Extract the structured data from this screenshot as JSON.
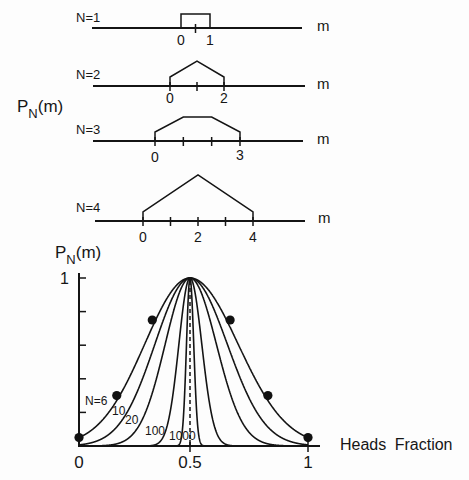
{
  "chart_data": [
    {
      "type": "line",
      "title": "",
      "ylabel": "P_N(m)",
      "ylabel_parts": {
        "base": "P",
        "sub": "N",
        "arg": "(m)"
      },
      "xlabel": "m",
      "grid": false,
      "series": [
        {
          "name": "N=1",
          "label": "N=1",
          "axis_label": "m",
          "ticks": [
            0.5
          ],
          "tick_labels": [
            {
              "m": 0,
              "text": "0"
            },
            {
              "m": 1,
              "text": "1"
            }
          ],
          "shape": [
            [
              0,
              0
            ],
            [
              0,
              14
            ],
            [
              1,
              14
            ],
            [
              1,
              0
            ]
          ]
        },
        {
          "name": "N=2",
          "label": "N=2",
          "axis_label": "m",
          "ticks": [
            0,
            1,
            2
          ],
          "tick_labels": [
            {
              "m": 0,
              "text": "0"
            },
            {
              "m": 2,
              "text": "2"
            }
          ],
          "shape": [
            [
              0,
              0
            ],
            [
              0,
              9
            ],
            [
              1,
              25
            ],
            [
              2,
              9
            ],
            [
              2,
              0
            ]
          ]
        },
        {
          "name": "N=3",
          "label": "N=3",
          "axis_label": "m",
          "ticks": [
            0,
            1,
            2,
            3
          ],
          "tick_labels": [
            {
              "m": 0,
              "text": "0"
            },
            {
              "m": 3,
              "text": "3"
            }
          ],
          "shape": [
            [
              0,
              0
            ],
            [
              0,
              9
            ],
            [
              1,
              24
            ],
            [
              2,
              24
            ],
            [
              3,
              9
            ],
            [
              3,
              0
            ]
          ]
        },
        {
          "name": "N=4",
          "label": "N=4",
          "axis_label": "m",
          "ticks": [
            0,
            1,
            2,
            3,
            4
          ],
          "tick_labels": [
            {
              "m": 0,
              "text": "0"
            },
            {
              "m": 2,
              "text": "2"
            },
            {
              "m": 4,
              "text": "4"
            }
          ],
          "shape": [
            [
              0,
              0
            ],
            [
              0,
              9
            ],
            [
              2,
              46
            ],
            [
              4,
              9
            ],
            [
              4,
              0
            ]
          ]
        }
      ]
    },
    {
      "type": "line",
      "title": "",
      "ylabel": "P_N(m)",
      "ylabel_parts": {
        "base": "P",
        "sub": "N",
        "arg": "(m)"
      },
      "xlabel": "Heads Fraction",
      "xlim": [
        0,
        1
      ],
      "ylim": [
        0,
        1
      ],
      "grid": false,
      "x_ticks": [
        0,
        0.5,
        1
      ],
      "x_tick_labels": [
        "0",
        "0.5",
        "1"
      ],
      "y_ticks": [
        0.2,
        0.4,
        0.6,
        0.8,
        1.0
      ],
      "y_tick_labels": [
        "",
        "",
        "",
        "",
        "1"
      ],
      "x": [
        0,
        0.1,
        0.2,
        0.3,
        0.4,
        0.5,
        0.6,
        0.7,
        0.8,
        0.9,
        1.0
      ],
      "series": [
        {
          "name": "N=6",
          "label": "N=6",
          "N": 6,
          "values": [
            0.05,
            0.15,
            0.34,
            0.62,
            0.89,
            1,
            0.89,
            0.62,
            0.34,
            0.15,
            0.05
          ]
        },
        {
          "name": "N=10",
          "label": "10",
          "N": 10,
          "values": [
            0.01,
            0.04,
            0.17,
            0.45,
            0.82,
            1,
            0.82,
            0.45,
            0.17,
            0.04,
            0.01
          ]
        },
        {
          "name": "N=20",
          "label": "20",
          "N": 20,
          "values": [
            0,
            0,
            0.03,
            0.2,
            0.67,
            1,
            0.67,
            0.2,
            0.03,
            0,
            0
          ]
        },
        {
          "name": "N=100",
          "label": "100",
          "N": 100,
          "values": [
            0,
            0,
            0,
            0,
            0.14,
            1,
            0.14,
            0,
            0,
            0,
            0
          ]
        },
        {
          "name": "N=1000",
          "label": "1000",
          "N": 1000,
          "values": [
            0,
            0,
            0,
            0,
            0,
            1,
            0,
            0,
            0,
            0,
            0
          ]
        }
      ],
      "markers": {
        "series": "N=6",
        "x": [
          0,
          0.17,
          0.33,
          0.67,
          0.83,
          1
        ],
        "y": [
          0.05,
          0.3,
          0.75,
          0.75,
          0.3,
          0.05
        ]
      },
      "reference_line": {
        "x": 0.5,
        "style": "dashed"
      }
    }
  ]
}
